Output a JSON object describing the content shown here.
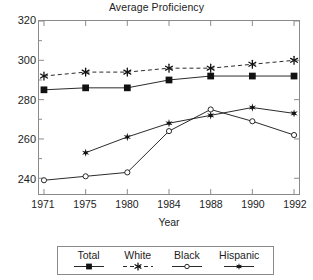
{
  "chart_data": {
    "type": "line",
    "title": "Average Proficiency",
    "xlabel": "Year",
    "ylabel": "",
    "grid": false,
    "legend_position": "bottom",
    "categories": [
      "1971",
      "1975",
      "1980",
      "1984",
      "1988",
      "1990",
      "1992"
    ],
    "x": [
      1971,
      1975,
      1980,
      1984,
      1988,
      1990,
      1992
    ],
    "xlim": [
      1971,
      1992
    ],
    "ylim": [
      232,
      320
    ],
    "yticks": [
      320,
      300,
      280,
      260,
      240
    ],
    "ytick_labels": [
      "320",
      "300",
      "280",
      "260",
      "240"
    ],
    "xtick_labels": [
      "1971",
      "1975",
      "1980",
      "1984",
      "1988",
      "1990",
      "1992"
    ],
    "series": [
      {
        "name": "Total",
        "marker": "filled-square",
        "linestyle": "solid",
        "color": "#111111",
        "values": [
          285,
          286,
          286,
          290,
          292,
          292,
          292
        ]
      },
      {
        "name": "White",
        "marker": "asterisk",
        "linestyle": "dashed",
        "color": "#111111",
        "values": [
          292,
          294,
          294,
          296,
          296,
          298,
          300
        ]
      },
      {
        "name": "Black",
        "marker": "open-circle",
        "linestyle": "solid",
        "color": "#111111",
        "values": [
          239,
          241,
          243,
          264,
          275,
          269,
          262
        ]
      },
      {
        "name": "Hispanic",
        "marker": "filled-star",
        "linestyle": "solid",
        "color": "#111111",
        "values": [
          null,
          253,
          261,
          268,
          272,
          276,
          273
        ]
      }
    ]
  },
  "legend": {
    "items": [
      {
        "label": "Total",
        "marker": "filled-square",
        "linestyle": "solid"
      },
      {
        "label": "White",
        "marker": "asterisk",
        "linestyle": "dashed"
      },
      {
        "label": "Black",
        "marker": "open-circle",
        "linestyle": "solid"
      },
      {
        "label": "Hispanic",
        "marker": "filled-star",
        "linestyle": "solid"
      }
    ]
  },
  "colors": {
    "ink": "#111111",
    "frame": "#8a8a8a",
    "background": "#ffffff"
  }
}
